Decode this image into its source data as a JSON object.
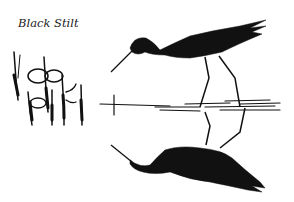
{
  "caption": "Black Stilt",
  "colors": {
    "ink": "#111111",
    "background": "#ffffff"
  }
}
